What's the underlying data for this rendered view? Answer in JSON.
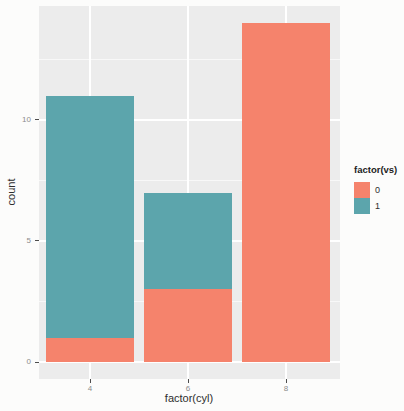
{
  "chart_data": {
    "type": "bar",
    "stacked": true,
    "title": "",
    "xlabel": "factor(cyl)",
    "ylabel": "count",
    "legend_title": "factor(vs)",
    "legend_position": "right",
    "categories": [
      "4",
      "6",
      "8"
    ],
    "series": [
      {
        "name": "0",
        "color": "#f5836c",
        "values": [
          1,
          3,
          14
        ]
      },
      {
        "name": "1",
        "color": "#5ca5ac",
        "values": [
          10,
          4,
          0
        ]
      }
    ],
    "ylim": [
      0,
      14
    ],
    "yticks": [
      0,
      5,
      10
    ],
    "grid": "on",
    "panel_background": "#ececec",
    "gridline_color": "#ffffff"
  }
}
